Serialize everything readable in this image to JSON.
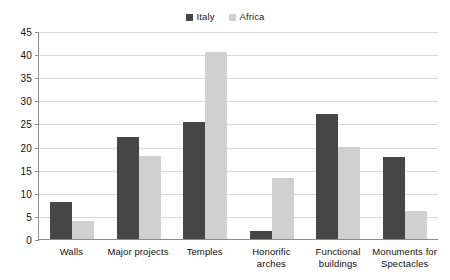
{
  "chart_data": {
    "type": "bar",
    "title": "",
    "subtitle": "",
    "xlabel": "",
    "ylabel": "",
    "ylim": [
      0,
      45
    ],
    "ytick_step": 5,
    "yticks": [
      45,
      40,
      35,
      30,
      25,
      20,
      15,
      10,
      5,
      0
    ],
    "grid": true,
    "legend_position": "top-center",
    "categories": [
      "Walls",
      "Major projects",
      "Temples",
      "Honorific arches",
      "Functional buildings",
      "Monuments for Spectacles"
    ],
    "series": [
      {
        "name": "Italy",
        "color": "#464646",
        "values": [
          8,
          22,
          25.3,
          1.8,
          27,
          17.8
        ]
      },
      {
        "name": "Africa",
        "color": "#d0d0d0",
        "values": [
          4,
          18,
          40.5,
          13.3,
          20,
          6.1
        ]
      }
    ]
  },
  "legend": {
    "entries": [
      {
        "label": "Italy",
        "color": "#464646"
      },
      {
        "label": "Africa",
        "color": "#d0d0d0"
      }
    ]
  },
  "axes": {
    "y_tick_labels": [
      "45",
      "40",
      "35",
      "30",
      "25",
      "20",
      "15",
      "10",
      "5",
      "0"
    ],
    "x_tick_labels": [
      "Walls",
      "Major projects",
      "Temples",
      "Honorific arches",
      "Functional buildings",
      "Monuments for Spectacles"
    ]
  }
}
